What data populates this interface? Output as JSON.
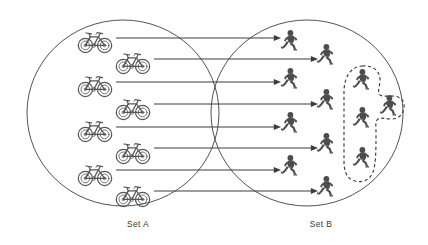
{
  "diagram": {
    "type": "set-mapping-diagram",
    "title_visible": false,
    "background_color": "#ffffff",
    "ink_color": "#3d3d3d",
    "person_color": "#4d4d4d",
    "bicycle_color": "#565656",
    "sets": [
      {
        "id": "set-a",
        "label": "Set A",
        "label_x": 138,
        "label_y": 227,
        "circle": {
          "cx": 123,
          "cy": 113,
          "rx": 96,
          "ry": 93
        },
        "item_icon": "bicycle-icon",
        "item_count": 8,
        "items": [
          {
            "index": 0,
            "x": 95,
            "y": 41,
            "icon": "bicycle-icon"
          },
          {
            "index": 1,
            "x": 133,
            "y": 62,
            "icon": "bicycle-icon"
          },
          {
            "index": 2,
            "x": 95,
            "y": 85,
            "icon": "bicycle-icon"
          },
          {
            "index": 3,
            "x": 133,
            "y": 108,
            "icon": "bicycle-icon"
          },
          {
            "index": 4,
            "x": 95,
            "y": 130,
            "icon": "bicycle-icon"
          },
          {
            "index": 5,
            "x": 133,
            "y": 152,
            "icon": "bicycle-icon"
          },
          {
            "index": 6,
            "x": 95,
            "y": 174,
            "icon": "bicycle-icon"
          },
          {
            "index": 7,
            "x": 133,
            "y": 195,
            "icon": "bicycle-icon"
          }
        ]
      },
      {
        "id": "set-b",
        "label": "Set B",
        "label_x": 321,
        "label_y": 227,
        "circle": {
          "cx": 307,
          "cy": 113,
          "rx": 96,
          "ry": 93
        },
        "item_icon": "person-icon",
        "item_count": 12,
        "mapped_count": 8,
        "unmapped_count": 4,
        "items": [
          {
            "index": 0,
            "x": 290,
            "y": 41,
            "icon": "person-icon",
            "mapped": true
          },
          {
            "index": 1,
            "x": 326,
            "y": 55,
            "icon": "person-icon",
            "mapped": true
          },
          {
            "index": 2,
            "x": 290,
            "y": 79,
            "icon": "person-icon",
            "mapped": true
          },
          {
            "index": 3,
            "x": 326,
            "y": 100,
            "icon": "person-icon",
            "mapped": true
          },
          {
            "index": 4,
            "x": 290,
            "y": 123,
            "icon": "person-icon",
            "mapped": true
          },
          {
            "index": 5,
            "x": 326,
            "y": 144,
            "icon": "person-icon",
            "mapped": true
          },
          {
            "index": 6,
            "x": 290,
            "y": 166,
            "icon": "person-icon",
            "mapped": true
          },
          {
            "index": 7,
            "x": 326,
            "y": 187,
            "icon": "person-icon",
            "mapped": true
          },
          {
            "index": 8,
            "x": 362,
            "y": 80,
            "icon": "person-icon",
            "mapped": false,
            "in_dashed_region": true
          },
          {
            "index": 9,
            "x": 389,
            "y": 106,
            "icon": "person-icon",
            "mapped": false,
            "in_dashed_region": true
          },
          {
            "index": 10,
            "x": 362,
            "y": 118,
            "icon": "person-icon",
            "mapped": false,
            "in_dashed_region": true
          },
          {
            "index": 11,
            "x": 362,
            "y": 158,
            "icon": "person-icon",
            "mapped": false,
            "in_dashed_region": true
          }
        ]
      }
    ],
    "dashed_region": {
      "id": "unmapped-region",
      "style": "dashed",
      "enclosed_item_count": 4,
      "description_visible": false
    },
    "arrows": [
      {
        "index": 0,
        "from_x": 116,
        "from_y": 38,
        "to_x": 281,
        "to_y": 38
      },
      {
        "index": 1,
        "from_x": 154,
        "from_y": 59,
        "to_x": 318,
        "to_y": 59
      },
      {
        "index": 2,
        "from_x": 116,
        "from_y": 82,
        "to_x": 281,
        "to_y": 82
      },
      {
        "index": 3,
        "from_x": 154,
        "from_y": 104,
        "to_x": 318,
        "to_y": 104
      },
      {
        "index": 4,
        "from_x": 116,
        "from_y": 127,
        "to_x": 281,
        "to_y": 127
      },
      {
        "index": 5,
        "from_x": 154,
        "from_y": 148,
        "to_x": 318,
        "to_y": 148
      },
      {
        "index": 6,
        "from_x": 116,
        "from_y": 170,
        "to_x": 281,
        "to_y": 170
      },
      {
        "index": 7,
        "from_x": 154,
        "from_y": 191,
        "to_x": 318,
        "to_y": 191
      }
    ],
    "arrow_count": 8
  }
}
